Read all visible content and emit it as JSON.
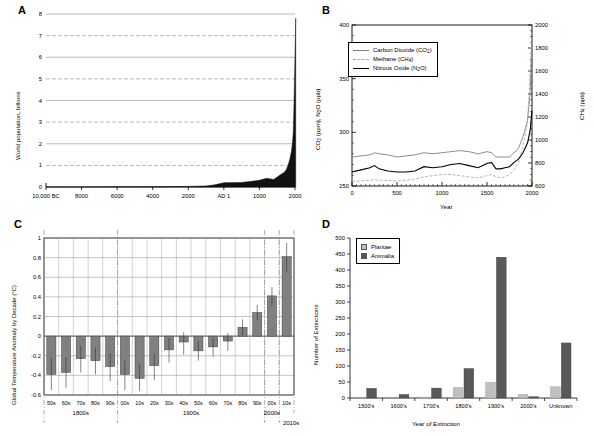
{
  "figure": {
    "panels": [
      "A",
      "B",
      "C",
      "D"
    ],
    "background": "#ffffff",
    "colors": {
      "axis": "#000000",
      "grid": "#808080",
      "bar_gray": "#808080",
      "plantae": "#bfbfbf",
      "animalia": "#595959",
      "co2_line": "#808080",
      "ch4_line": "#a6a6a6",
      "n2o_line": "#000000"
    }
  },
  "panelA": {
    "letter": "A",
    "ylabel": "World population, billions",
    "yticks": [
      "0",
      "1",
      "2",
      "3",
      "4",
      "5",
      "6",
      "7",
      "8"
    ],
    "xticks": [
      "10,000 BC",
      "8000",
      "6000",
      "4000",
      "2000",
      "AD 1",
      "1000",
      "2000"
    ]
  },
  "panelB": {
    "letter": "B",
    "ylabel_left": "CO2 (ppm), N2O (ppb)",
    "ylabel_right": "CH4 (ppb)",
    "xlabel": "Year",
    "yticks_left": [
      "250",
      "300",
      "350",
      "400"
    ],
    "yticks_right": [
      "600",
      "800",
      "1000",
      "1200",
      "1400",
      "1600",
      "1800",
      "2000"
    ],
    "xticks": [
      "0",
      "500",
      "1000",
      "1500",
      "2000"
    ],
    "legend": [
      {
        "label": "Carbon Dioxide (CO2)",
        "style": "solid-gray"
      },
      {
        "label": "Methane (CH4)",
        "style": "dashed-gray"
      },
      {
        "label": "Nitrous Oxide (N2O)",
        "style": "solid-black"
      }
    ]
  },
  "panelC": {
    "letter": "C",
    "ylabel": "Global Temperature Anomaly by Decade (C)",
    "yticks": [
      "1",
      "0.8",
      "0.6",
      "0.4",
      "0.2",
      "0",
      "-0.2",
      "-0.4",
      "-0.6"
    ],
    "xticks": [
      "50s",
      "60s",
      "70s",
      "80s",
      "90s",
      "00s",
      "10s",
      "20s",
      "30s",
      "40s",
      "50s",
      "60s",
      "70s",
      "80s",
      "90s",
      "00s",
      "10s"
    ],
    "era_labels": [
      "1800s",
      "1900s",
      "2000s",
      "2010s"
    ]
  },
  "panelD": {
    "letter": "D",
    "ylabel": "Number of Extinctions",
    "xlabel": "Year of Extinction",
    "yticks": [
      "0",
      "50",
      "100",
      "150",
      "200",
      "250",
      "300",
      "350",
      "400",
      "450",
      "500"
    ],
    "legend": [
      "Plantae",
      "Animalia"
    ]
  },
  "chart_data": [
    {
      "type": "area",
      "panel": "A",
      "title": "",
      "xlabel": "",
      "ylabel": "World population, billions",
      "ylim": [
        0,
        8
      ],
      "xtick_labels": [
        "10,000 BC",
        "8000",
        "6000",
        "4000",
        "2000",
        "AD 1",
        "1000",
        "2000"
      ],
      "xtick_years": [
        -10000,
        -8000,
        -6000,
        -4000,
        -2000,
        1,
        1000,
        2000
      ],
      "grid": true,
      "x": [
        -10000,
        -8000,
        -6000,
        -5000,
        -4000,
        -3000,
        -2000,
        -1000,
        -500,
        1,
        500,
        1000,
        1200,
        1400,
        1500,
        1600,
        1700,
        1750,
        1800,
        1850,
        1900,
        1927,
        1950,
        1960,
        1974,
        1987,
        1999,
        2011,
        2020
      ],
      "values": [
        0.004,
        0.005,
        0.007,
        0.01,
        0.014,
        0.02,
        0.027,
        0.05,
        0.1,
        0.2,
        0.21,
        0.31,
        0.4,
        0.35,
        0.46,
        0.58,
        0.68,
        0.79,
        0.98,
        1.26,
        1.65,
        2.0,
        2.5,
        3.0,
        4.0,
        5.0,
        6.0,
        7.0,
        7.8
      ]
    },
    {
      "type": "line",
      "panel": "B",
      "title": "",
      "xlabel": "Year",
      "ylabel": "CO2 (ppm), N2O (ppb)",
      "ylabel_secondary": "CH4 (ppb)",
      "xlim": [
        0,
        2000
      ],
      "ylim": [
        250,
        400
      ],
      "ylim_secondary": [
        600,
        2000
      ],
      "grid": false,
      "legend_position": "upper-left",
      "x": [
        0,
        100,
        200,
        250,
        300,
        400,
        500,
        600,
        700,
        800,
        900,
        1000,
        1100,
        1200,
        1300,
        1400,
        1500,
        1550,
        1600,
        1650,
        1700,
        1750,
        1800,
        1850,
        1900,
        1950,
        1980,
        2000
      ],
      "series": [
        {
          "name": "Carbon Dioxide (CO2)",
          "axis": "left",
          "unit": "ppm",
          "values": [
            277,
            278,
            279,
            281,
            280,
            279,
            277,
            278,
            279,
            281,
            280,
            281,
            282,
            283,
            282,
            280,
            282,
            281,
            277,
            277,
            277,
            277,
            281,
            285,
            296,
            311,
            338,
            385
          ]
        },
        {
          "name": "Methane (CH4)",
          "axis": "right",
          "unit": "ppb",
          "values": [
            640,
            645,
            650,
            655,
            650,
            648,
            645,
            650,
            660,
            680,
            690,
            700,
            700,
            690,
            680,
            670,
            690,
            700,
            680,
            670,
            680,
            700,
            740,
            800,
            950,
            1150,
            1600,
            1880
          ]
        },
        {
          "name": "Nitrous Oxide (N2O)",
          "axis": "left",
          "unit": "ppb",
          "values": [
            263,
            265,
            267,
            269,
            266,
            264,
            263,
            263,
            264,
            268,
            267,
            268,
            270,
            271,
            269,
            267,
            271,
            272,
            266,
            266,
            267,
            268,
            272,
            275,
            281,
            290,
            302,
            320
          ]
        }
      ]
    },
    {
      "type": "bar",
      "panel": "C",
      "title": "",
      "xlabel": "",
      "ylabel": "Global Temperature Anomaly by Decade (C)",
      "ylim": [
        -0.6,
        1.0
      ],
      "grid": true,
      "categories": [
        "50s",
        "60s",
        "70s",
        "80s",
        "90s",
        "00s",
        "10s",
        "20s",
        "30s",
        "40s",
        "50s",
        "60s",
        "70s",
        "80s",
        "90s",
        "00s",
        "10s"
      ],
      "era_groups": [
        {
          "label": "1800s",
          "categories": [
            "50s",
            "60s",
            "70s",
            "80s",
            "90s"
          ]
        },
        {
          "label": "1900s",
          "categories": [
            "00s",
            "10s",
            "20s",
            "30s",
            "40s",
            "50s",
            "60s",
            "70s",
            "80s",
            "90s"
          ]
        },
        {
          "label": "2000s",
          "categories": [
            "00s"
          ]
        },
        {
          "label": "2010s",
          "categories": [
            "10s"
          ]
        }
      ],
      "values": [
        -0.39,
        -0.37,
        -0.23,
        -0.25,
        -0.31,
        -0.39,
        -0.43,
        -0.3,
        -0.14,
        -0.06,
        -0.15,
        -0.11,
        -0.05,
        0.09,
        0.24,
        0.41,
        0.81
      ],
      "error_low": [
        -0.55,
        -0.53,
        -0.37,
        -0.39,
        -0.46,
        -0.55,
        -0.56,
        -0.45,
        -0.27,
        -0.19,
        -0.25,
        -0.21,
        -0.15,
        0.01,
        0.16,
        0.31,
        0.66
      ],
      "error_high": [
        -0.22,
        -0.21,
        -0.1,
        -0.12,
        -0.18,
        -0.25,
        -0.29,
        -0.18,
        -0.02,
        0.04,
        -0.05,
        -0.02,
        0.03,
        0.17,
        0.32,
        0.5,
        0.95
      ]
    },
    {
      "type": "bar",
      "panel": "D",
      "title": "",
      "xlabel": "Year of Extinction",
      "ylabel": "Number of Extinctions",
      "ylim": [
        0,
        500
      ],
      "grid": false,
      "legend_position": "upper-left",
      "categories": [
        "1500's",
        "1600's",
        "1700's",
        "1800's",
        "1900's",
        "2000's",
        "Unknown"
      ],
      "series": [
        {
          "name": "Plantae",
          "values": [
            1,
            0,
            3,
            33,
            49,
            11,
            35
          ]
        },
        {
          "name": "Animalia",
          "values": [
            30,
            11,
            31,
            92,
            440,
            4,
            172
          ]
        }
      ]
    }
  ]
}
